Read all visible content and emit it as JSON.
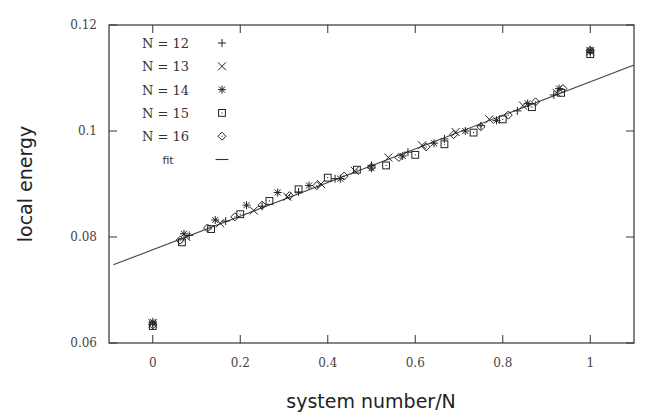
{
  "chart_data": {
    "type": "scatter",
    "title": "",
    "xlabel": "system number/N",
    "ylabel": "local energy",
    "xlim": [
      -0.1,
      1.1
    ],
    "ylim": [
      0.06,
      0.12
    ],
    "xticks": [
      0,
      0.2,
      0.4,
      0.6,
      0.8,
      1
    ],
    "xtick_labels": [
      "0",
      "0.2",
      "0.4",
      "0.6",
      "0.8",
      "1"
    ],
    "yticks": [
      0.06,
      0.08,
      0.1,
      0.12
    ],
    "ytick_labels": [
      "0.06",
      "0.08",
      "0.1",
      "0.12"
    ],
    "grid": false,
    "legend_position": "upper left",
    "legend": [
      {
        "label": "N = 12",
        "marker": "plus"
      },
      {
        "label": "N = 13",
        "marker": "cross"
      },
      {
        "label": "N = 14",
        "marker": "asterisk"
      },
      {
        "label": "N = 15",
        "marker": "square"
      },
      {
        "label": "N = 16",
        "marker": "diamond"
      },
      {
        "label": "fit",
        "marker": "line"
      }
    ],
    "fit": {
      "slope": 0.0317,
      "intercept": 0.0776,
      "x_range": [
        -0.09,
        1.1
      ]
    },
    "series": [
      {
        "name": "N = 12",
        "marker": "plus",
        "x": [
          0,
          0.0833,
          0.1667,
          0.25,
          0.3333,
          0.4167,
          0.5,
          0.5833,
          0.6667,
          0.75,
          0.8333,
          0.9167,
          1
        ],
        "y": [
          0.0635,
          0.0803,
          0.083,
          0.0858,
          0.0885,
          0.091,
          0.0935,
          0.096,
          0.0985,
          0.101,
          0.1038,
          0.1068,
          0.1148
        ]
      },
      {
        "name": "N = 13",
        "marker": "cross",
        "x": [
          0,
          0.0769,
          0.1538,
          0.2308,
          0.3077,
          0.3846,
          0.4615,
          0.5385,
          0.6154,
          0.6923,
          0.7692,
          0.8462,
          0.9231,
          1
        ],
        "y": [
          0.0637,
          0.08,
          0.0826,
          0.085,
          0.0876,
          0.09,
          0.0925,
          0.095,
          0.0973,
          0.0998,
          0.1022,
          0.1048,
          0.1072,
          0.115
        ]
      },
      {
        "name": "N = 14",
        "marker": "asterisk",
        "x": [
          0,
          0.0714,
          0.1429,
          0.2143,
          0.2857,
          0.3571,
          0.4286,
          0.5,
          0.5714,
          0.6429,
          0.7143,
          0.7857,
          0.8571,
          0.9286,
          1
        ],
        "y": [
          0.064,
          0.0806,
          0.0832,
          0.086,
          0.0884,
          0.0897,
          0.091,
          0.093,
          0.0953,
          0.0977,
          0.1,
          0.102,
          0.1052,
          0.108,
          0.1153
        ]
      },
      {
        "name": "N = 15",
        "marker": "square",
        "x": [
          0,
          0.0667,
          0.1333,
          0.2,
          0.2667,
          0.3333,
          0.4,
          0.4667,
          0.5333,
          0.6,
          0.6667,
          0.7333,
          0.8,
          0.8667,
          0.9333,
          1
        ],
        "y": [
          0.0632,
          0.079,
          0.0815,
          0.0843,
          0.0868,
          0.089,
          0.0912,
          0.0927,
          0.0935,
          0.0955,
          0.0975,
          0.0997,
          0.1022,
          0.1045,
          0.1072,
          0.1145
        ]
      },
      {
        "name": "N = 16",
        "marker": "diamond",
        "x": [
          0,
          0.0625,
          0.125,
          0.1875,
          0.25,
          0.3125,
          0.375,
          0.4375,
          0.5,
          0.5625,
          0.625,
          0.6875,
          0.75,
          0.8125,
          0.875,
          0.9375,
          1
        ],
        "y": [
          0.0634,
          0.0794,
          0.0817,
          0.0838,
          0.086,
          0.0878,
          0.0897,
          0.0915,
          0.0932,
          0.095,
          0.097,
          0.0993,
          0.1008,
          0.103,
          0.1055,
          0.108,
          0.1152
        ]
      }
    ]
  }
}
